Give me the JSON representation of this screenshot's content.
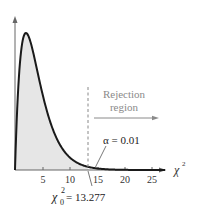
{
  "chart_data": {
    "type": "area",
    "title": "",
    "xlabel": "χ²",
    "ylabel": "",
    "distribution": "chi-square",
    "degrees_of_freedom": 4,
    "x_ticks": [
      5,
      10,
      15,
      20,
      25
    ],
    "xlim": [
      0,
      28
    ],
    "critical_value": 13.277,
    "alpha": 0.01,
    "annotations": {
      "critical_label": "χ₀² = 13.277",
      "alpha_label": "α = 0.01",
      "rejection_line1": "Rejection",
      "rejection_line2": "region"
    },
    "shaded_region": [
      0,
      13.277
    ],
    "grid": false,
    "legend": null
  },
  "labels": {
    "tick_5": "5",
    "tick_10": "10",
    "tick_15": "15",
    "tick_20": "20",
    "tick_25": "25",
    "x_axis_symbol": "χ",
    "x_axis_sup": "2",
    "rejection_line1": "Rejection",
    "rejection_line2": "region",
    "alpha_text": "α = 0.01",
    "crit_chi": "χ",
    "crit_sub": "0",
    "crit_sup": "2",
    "crit_value": " = 13.277"
  },
  "colors": {
    "curve": "#1a1a1a",
    "fill": "#e6e6e6",
    "axis": "#555555",
    "annotation_gray": "#8a8a8a",
    "text": "#222222"
  }
}
